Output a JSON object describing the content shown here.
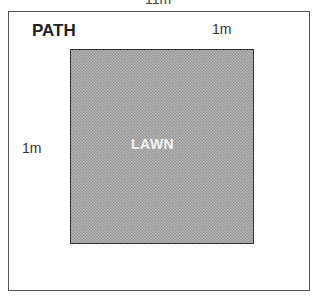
{
  "diagram": {
    "top_dimension_label": "11m",
    "path_label": "PATH",
    "path_width_top": "1m",
    "path_width_left": "1m",
    "lawn_label": "LAWN"
  },
  "colors": {
    "border": "#555555",
    "lawn_fill": "#b8b8b8",
    "lawn_text": "#f4f4f4"
  }
}
